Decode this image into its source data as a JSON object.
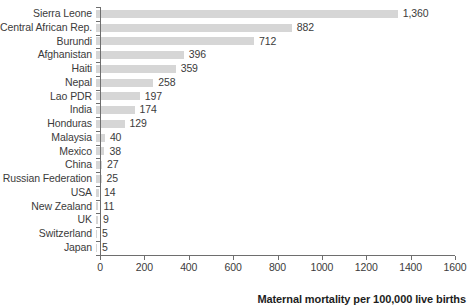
{
  "chart_data": {
    "type": "bar",
    "orientation": "horizontal",
    "title": "",
    "subtitle": "",
    "xlabel": "Maternal mortality per 100,000 live births",
    "ylabel": "",
    "xlim": [
      0,
      1600
    ],
    "xticks": [
      0,
      200,
      400,
      600,
      800,
      1000,
      1200,
      1400,
      1600
    ],
    "xtick_labels": [
      "0",
      "200",
      "400",
      "600",
      "800",
      "1000",
      "1200",
      "1400",
      "1600"
    ],
    "grid": false,
    "legend": null,
    "bar_color": "#d6d6d6",
    "categories": [
      "Sierra Leone",
      "Central African Rep.",
      "Burundi",
      "Afghanistan",
      "Haiti",
      "Nepal",
      "Lao PDR",
      "India",
      "Honduras",
      "Malaysia",
      "Mexico",
      "China",
      "Russian Federation",
      "USA",
      "New Zealand",
      "UK",
      "Switzerland",
      "Japan"
    ],
    "values": [
      1360,
      882,
      712,
      396,
      359,
      258,
      197,
      174,
      129,
      40,
      38,
      27,
      25,
      14,
      11,
      9,
      5,
      5
    ],
    "value_labels": [
      "1,360",
      "882",
      "712",
      "396",
      "359",
      "258",
      "197",
      "174",
      "129",
      "40",
      "38",
      "27",
      "25",
      "14",
      "11",
      "9",
      "5",
      "5"
    ]
  }
}
